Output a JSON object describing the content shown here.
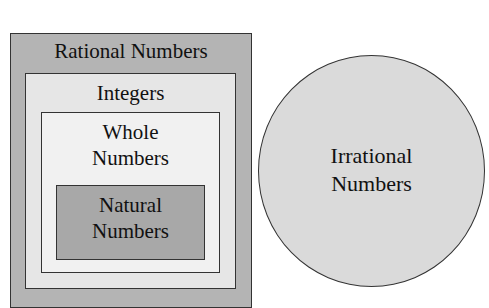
{
  "diagram": {
    "sets": {
      "rational": {
        "label": "Rational Numbers",
        "color": "#b4b4b4"
      },
      "integers": {
        "label": "Integers",
        "color": "#e6e6e6"
      },
      "whole": {
        "label_line1": "Whole",
        "label_line2": "Numbers",
        "color": "#f1f1f1"
      },
      "natural": {
        "label_line1": "Natural",
        "label_line2": "Numbers",
        "color": "#a8a8a8"
      },
      "irrational": {
        "label_line1": "Irrational",
        "label_line2": "Numbers",
        "color": "#dadada"
      }
    },
    "relationships": [
      "natural ⊂ whole",
      "whole ⊂ integers",
      "integers ⊂ rational",
      "rational and irrational are disjoint"
    ]
  }
}
